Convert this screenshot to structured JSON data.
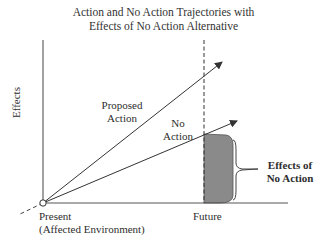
{
  "title": {
    "line1": "Action and No Action Trajectories with",
    "line2": "Effects of No Action Alternative"
  },
  "axes": {
    "y_label": "Effects",
    "x_origin_label": "Present",
    "x_origin_sublabel": "(Affected Environment)",
    "x_future_label": "Future"
  },
  "trajectories": [
    {
      "name": "proposed-action",
      "label_line1": "Proposed",
      "label_line2": "Action"
    },
    {
      "name": "no-action",
      "label_line1": "No",
      "label_line2": "Action"
    }
  ],
  "callout": {
    "line1": "Effects of",
    "line2": "No Action"
  },
  "colors": {
    "line": "#333333",
    "shaded_region": "#8a8a8a",
    "background": "#ffffff"
  }
}
